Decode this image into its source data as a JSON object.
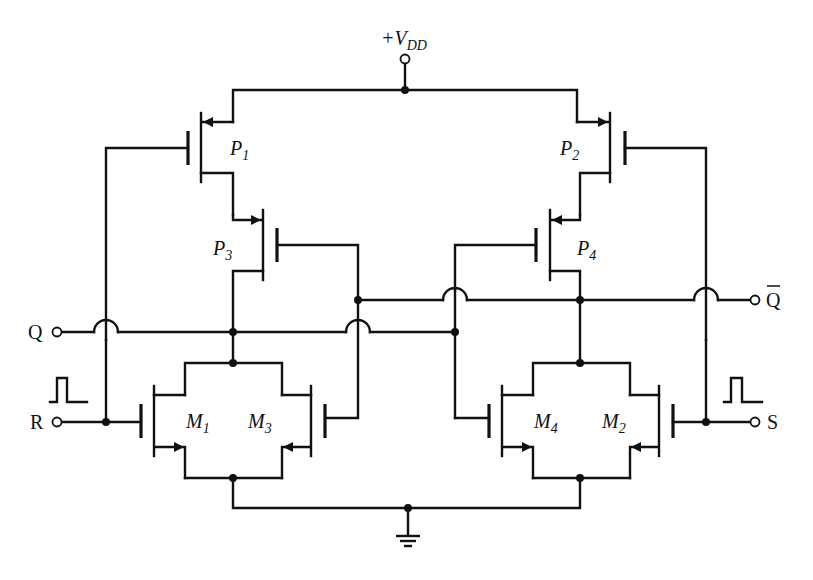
{
  "diagram": {
    "type": "CMOS SR latch circuit schematic",
    "supply": {
      "label_prefix": "+V",
      "label_sub": "DD"
    },
    "ground": {
      "icon": "ground-icon"
    },
    "transistors": [
      {
        "id": "P1",
        "type": "PMOS",
        "letter": "P",
        "sub": "1"
      },
      {
        "id": "P2",
        "type": "PMOS",
        "letter": "P",
        "sub": "2"
      },
      {
        "id": "P3",
        "type": "PMOS",
        "letter": "P",
        "sub": "3"
      },
      {
        "id": "P4",
        "type": "PMOS",
        "letter": "P",
        "sub": "4"
      },
      {
        "id": "M1",
        "type": "NMOS",
        "letter": "M",
        "sub": "1"
      },
      {
        "id": "M2",
        "type": "NMOS",
        "letter": "M",
        "sub": "2"
      },
      {
        "id": "M3",
        "type": "NMOS",
        "letter": "M",
        "sub": "3"
      },
      {
        "id": "M4",
        "type": "NMOS",
        "letter": "M",
        "sub": "4"
      }
    ],
    "terminals": {
      "q": "Q",
      "q_bar": "Q",
      "r": "R",
      "s": "S"
    },
    "pulse_icons": [
      "pulse-icon-r",
      "pulse-icon-s"
    ],
    "colors": {
      "line": "#111111",
      "background": "#ffffff"
    }
  }
}
